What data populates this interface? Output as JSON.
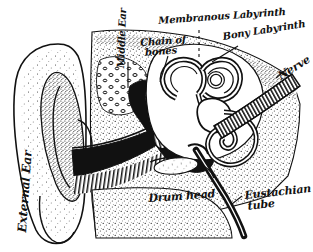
{
  "figure": {
    "kind": "anatomical-diagram",
    "style": "black-and-white stipple engraving",
    "background_color": "#ffffff",
    "ink_color": "#111111",
    "width": 313,
    "height": 252
  },
  "labels": {
    "membranous_labyrinth": "Membranous Labyrinth",
    "bony_labyrinth": "Bony Labyrinth",
    "chain_of_bones_line1": "Chain of",
    "chain_of_bones_line2": "bones",
    "nerve": "Nerve",
    "middle_ear": "Middle Ear",
    "external_ear": "External Ear",
    "canal": "Canal",
    "drum_head": "Drum head",
    "eustachian_tube_line1": "Eustachian",
    "eustachian_tube_line2": "tube"
  },
  "structures": [
    {
      "name": "pinna",
      "label": "External Ear"
    },
    {
      "name": "ear-canal",
      "label": "Canal"
    },
    {
      "name": "eardrum",
      "label": "Drum head"
    },
    {
      "name": "ossicles",
      "label": "Chain of bones"
    },
    {
      "name": "middle-ear-cavity",
      "label": "Middle Ear"
    },
    {
      "name": "membranous-labyrinth",
      "label": "Membranous Labyrinth"
    },
    {
      "name": "bony-labyrinth",
      "label": "Bony Labyrinth"
    },
    {
      "name": "auditory-nerve",
      "label": "Nerve"
    },
    {
      "name": "eustachian-tube",
      "label": "Eustachian tube"
    }
  ]
}
